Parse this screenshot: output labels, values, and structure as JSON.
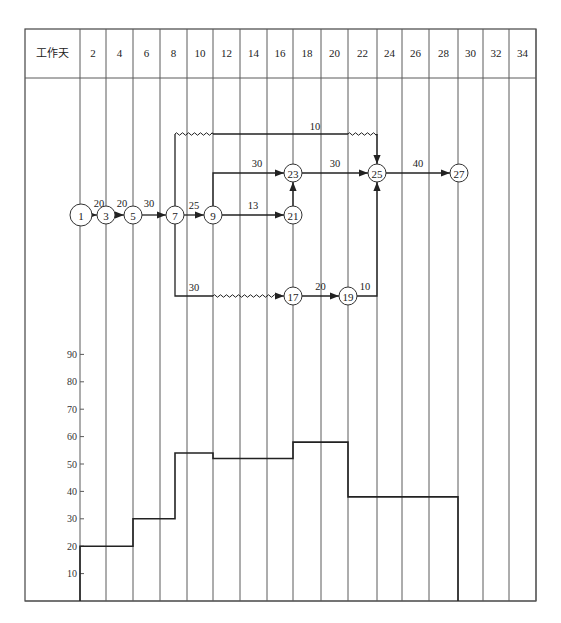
{
  "header": {
    "row_label": "工作天",
    "days": [
      "2",
      "4",
      "6",
      "8",
      "10",
      "12",
      "14",
      "16",
      "18",
      "20",
      "22",
      "24",
      "26",
      "28",
      "30",
      "32",
      "34"
    ]
  },
  "network": {
    "nodes": [
      {
        "id": "1",
        "day": 0,
        "row": "main"
      },
      {
        "id": "3",
        "day": 2,
        "row": "main"
      },
      {
        "id": "5",
        "day": 4,
        "row": "main"
      },
      {
        "id": "7",
        "day": 7,
        "row": "main"
      },
      {
        "id": "9",
        "day": 10,
        "row": "main"
      },
      {
        "id": "21",
        "day": 16,
        "row": "main"
      },
      {
        "id": "23",
        "day": 16,
        "row": "upper"
      },
      {
        "id": "25",
        "day": 22,
        "row": "upper"
      },
      {
        "id": "27",
        "day": 28,
        "row": "upper"
      },
      {
        "id": "17",
        "day": 16,
        "row": "lower"
      },
      {
        "id": "19",
        "day": 20,
        "row": "lower"
      }
    ],
    "activities": [
      {
        "from": "1",
        "to": "3",
        "label": "20"
      },
      {
        "from": "3",
        "to": "5",
        "label": "20"
      },
      {
        "from": "5",
        "to": "7",
        "label": "30"
      },
      {
        "from": "7",
        "to": "9",
        "label": "25"
      },
      {
        "from": "9",
        "to": "21",
        "label": "13"
      },
      {
        "from": "9",
        "to": "23",
        "label": "30"
      },
      {
        "from": "21",
        "to": "23",
        "label": ""
      },
      {
        "from": "23",
        "to": "25",
        "label": "30"
      },
      {
        "from": "25",
        "to": "27",
        "label": "40"
      },
      {
        "from": "7",
        "to": "25",
        "label": "10",
        "path": "top",
        "float": "wavy"
      },
      {
        "from": "7",
        "to": "17",
        "label": "30",
        "path": "bottom",
        "float": "wavy"
      },
      {
        "from": "17",
        "to": "19",
        "label": "20"
      },
      {
        "from": "19",
        "to": "25",
        "label": "10"
      }
    ]
  },
  "chart_data": {
    "type": "step",
    "title": "",
    "xlabel": "工作天",
    "ylabel": "",
    "y_ticks": [
      10,
      20,
      30,
      40,
      50,
      60,
      70,
      80,
      90
    ],
    "ylim": [
      0,
      95
    ],
    "xlim": [
      0,
      34
    ],
    "segments": [
      {
        "start": 0,
        "end": 4,
        "value": 20
      },
      {
        "start": 4,
        "end": 7,
        "value": 30
      },
      {
        "start": 7,
        "end": 10,
        "value": 54
      },
      {
        "start": 10,
        "end": 16,
        "value": 52
      },
      {
        "start": 16,
        "end": 20,
        "value": 58
      },
      {
        "start": 20,
        "end": 28,
        "value": 38
      }
    ]
  }
}
